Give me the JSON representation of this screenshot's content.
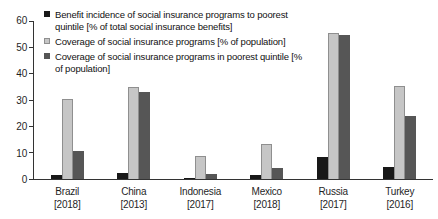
{
  "chart_data": {
    "type": "bar",
    "title": "",
    "categories": [
      "Brazil",
      "China",
      "Indonesia",
      "Mexico",
      "Russia",
      "Turkey"
    ],
    "category_years": [
      "[2018]",
      "[2013]",
      "[2017]",
      "[2018]",
      "[2017]",
      "[2016]"
    ],
    "series": [
      {
        "name": "Benefit incidence of social insurance programs to poorest quintile [% of total social insurance benefits]",
        "color": "#181818",
        "values": [
          1.5,
          2.2,
          0.2,
          1.4,
          8.2,
          4.6
        ]
      },
      {
        "name": "Coverage of social insurance programs [% of population]",
        "color": "#c6c6c6",
        "border_color": "#8f8f8f",
        "values": [
          30.5,
          35.0,
          8.8,
          13.2,
          55.5,
          35.3
        ]
      },
      {
        "name": "Coverage of social insurance programs in poorest quintile [% of population]",
        "color": "#565656",
        "values": [
          10.8,
          33.0,
          2.0,
          4.3,
          54.5,
          24.0
        ]
      }
    ],
    "ylim": [
      0,
      60
    ],
    "y_ticks": [
      0,
      10,
      20,
      30,
      40,
      50,
      60
    ],
    "grid": "off",
    "legend_position": "top-left",
    "axis_color": "#333333",
    "text_color": "#1f1f1f"
  }
}
